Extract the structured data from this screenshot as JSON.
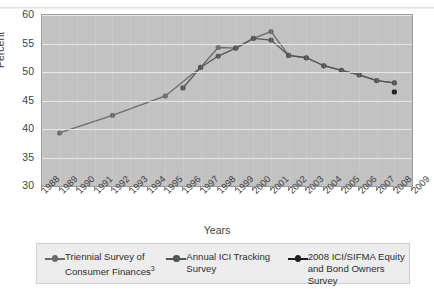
{
  "figure": {
    "title_fragment": "",
    "y_axis_title": "Percent",
    "x_axis_title": "Years"
  },
  "legend": {
    "items": [
      {
        "label_line1": "Triennial Survey of",
        "label_line2": "Consumer Finances",
        "superscript": "3",
        "color": "#6b6b6b"
      },
      {
        "label_line1": "Annual ICI Tracking",
        "label_line2": "Survey",
        "superscript": "",
        "color": "#555555"
      },
      {
        "label_line1": "2008 ICI/SIFMA Equity",
        "label_line2": "and Bond Owners Survey",
        "superscript": "",
        "color": "#1f1f1f"
      }
    ]
  },
  "chart_data": {
    "type": "line",
    "title": "",
    "xlabel": "Years",
    "ylabel": "Percent",
    "ylim": [
      30,
      60
    ],
    "yticks": [
      30,
      35,
      40,
      45,
      50,
      55,
      60
    ],
    "xlim": [
      1988,
      2009
    ],
    "xticks": [
      1988,
      1989,
      1990,
      1991,
      1992,
      1993,
      1994,
      1995,
      1996,
      1997,
      1998,
      1999,
      2000,
      2001,
      2002,
      2003,
      2004,
      2005,
      2006,
      2007,
      2008,
      2009
    ],
    "grid": "horizontal",
    "legend_position": "below",
    "plot_background": "#c2c2c2",
    "series": [
      {
        "name": "Triennial Survey of Consumer Finances",
        "color": "#6b6b6b",
        "points": [
          {
            "x": 1989,
            "y": 39.3
          },
          {
            "x": 1992,
            "y": 42.4
          },
          {
            "x": 1995,
            "y": 45.8
          },
          {
            "x": 1997,
            "y": 50.8
          },
          {
            "x": 1998,
            "y": 54.3
          },
          {
            "x": 1999,
            "y": 54.2
          },
          {
            "x": 2000,
            "y": 55.9
          },
          {
            "x": 2001,
            "y": 57.1
          },
          {
            "x": 2002,
            "y": 52.9
          },
          {
            "x": 2003,
            "y": 52.5
          },
          {
            "x": 2004,
            "y": 51.1
          },
          {
            "x": 2005,
            "y": 50.3
          },
          {
            "x": 2006,
            "y": 49.5
          },
          {
            "x": 2007,
            "y": 48.5
          },
          {
            "x": 2008,
            "y": 48.1
          }
        ]
      },
      {
        "name": "Annual ICI Tracking Survey",
        "color": "#555555",
        "points": [
          {
            "x": 1996,
            "y": 47.2
          },
          {
            "x": 1997,
            "y": 50.8
          },
          {
            "x": 1998,
            "y": 52.8
          },
          {
            "x": 1999,
            "y": 54.2
          },
          {
            "x": 2000,
            "y": 55.9
          },
          {
            "x": 2001,
            "y": 55.6
          },
          {
            "x": 2002,
            "y": 52.9
          },
          {
            "x": 2003,
            "y": 52.5
          },
          {
            "x": 2004,
            "y": 51.1
          },
          {
            "x": 2005,
            "y": 50.3
          },
          {
            "x": 2006,
            "y": 49.5
          },
          {
            "x": 2007,
            "y": 48.5
          },
          {
            "x": 2008,
            "y": 48.1
          }
        ]
      },
      {
        "name": "2008 ICI/SIFMA Equity and Bond Owners Survey",
        "color": "#1f1f1f",
        "points": [
          {
            "x": 2008,
            "y": 46.5
          }
        ]
      }
    ]
  }
}
